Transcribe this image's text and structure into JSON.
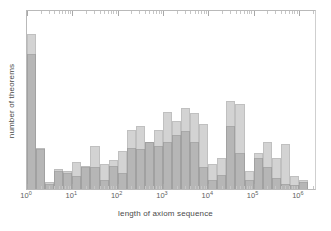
{
  "chart_data": {
    "type": "bar",
    "subtype": "histogram-overlay",
    "title": "",
    "xlabel": "length of axiom sequence",
    "ylabel": "number of theorems",
    "xscale": "log",
    "yscale": "linear",
    "xlim": [
      1,
      2511886
    ],
    "ylim": [
      0,
      1.0
    ],
    "grid": false,
    "legend": null,
    "xtick_labels": [
      "10",
      "10",
      "10",
      "10",
      "10",
      "10",
      "10"
    ],
    "xtick_exponents": [
      "0",
      "1",
      "2",
      "3",
      "4",
      "5",
      "6"
    ],
    "xtick_values": [
      1,
      10,
      100,
      1000,
      10000,
      100000,
      1000000
    ],
    "ytick_labels": [],
    "colors": {
      "series_0": "#969696",
      "series_1": "#8c8c8c",
      "axis": "#b9b9b9",
      "text": "#4a4a4a",
      "background": "#ffffff"
    },
    "bin_edges_log10": [
      0.0,
      0.2,
      0.4,
      0.6,
      0.8,
      1.0,
      1.2,
      1.4,
      1.6,
      1.8,
      2.0,
      2.2,
      2.4,
      2.6,
      2.8,
      3.0,
      3.2,
      3.4,
      3.6,
      3.8,
      4.0,
      4.2,
      4.4,
      4.6,
      4.8,
      5.0,
      5.2,
      5.4,
      5.6,
      5.8,
      6.0,
      6.2
    ],
    "series": [
      {
        "name": "series-0",
        "values": [
          0.86,
          0.22,
          0.03,
          0.1,
          0.09,
          0.15,
          0.12,
          0.24,
          0.14,
          0.16,
          0.21,
          0.33,
          0.35,
          0.26,
          0.33,
          0.43,
          0.38,
          0.45,
          0.42,
          0.36,
          0.14,
          0.17,
          0.49,
          0.47,
          0.1,
          0.2,
          0.26,
          0.17,
          0.25,
          0.07,
          0.05
        ]
      },
      {
        "name": "series-1",
        "values": [
          0.75,
          0.23,
          0.04,
          0.11,
          0.1,
          0.07,
          0.13,
          0.12,
          0.05,
          0.13,
          0.09,
          0.23,
          0.22,
          0.26,
          0.24,
          0.26,
          0.3,
          0.32,
          0.26,
          0.12,
          0.05,
          0.08,
          0.35,
          0.2,
          0.05,
          0.17,
          0.12,
          0.06,
          0.03,
          0.02,
          0.04
        ]
      }
    ]
  }
}
